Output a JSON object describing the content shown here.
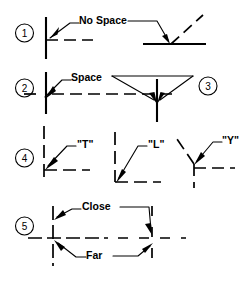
{
  "document": {
    "title": "Hidden Line Drafting Conventions",
    "type": "technical-line-drawing",
    "background_color": "#ffffff",
    "line_color": "#000000",
    "width": 246,
    "height": 282
  },
  "items": [
    {
      "number": "1",
      "marker": "①",
      "label": "No Space",
      "rule": "No space where a hidden line starts at a visible line",
      "figures": [
        {
          "name": "hidden-line-meets-vertical-solid",
          "kind": "solid-vertical-with-dashed-horizontal"
        },
        {
          "name": "hidden-line-meets-horizontal-solid",
          "kind": "solid-horizontal-with-dashed-diagonal"
        }
      ]
    },
    {
      "number": "2",
      "marker": "②",
      "label": "Space",
      "rule": "Leave a space where a hidden line crosses behind a visible line",
      "figures": [
        {
          "name": "dashed-crosses-solid-with-gap",
          "kind": "cross-with-space"
        }
      ]
    },
    {
      "number": "3",
      "marker": "③",
      "label": "",
      "rule": "Hidden line meeting a visible line at a junction",
      "figures": [
        {
          "name": "junction-double-leader",
          "kind": "v-leader-to-intersection"
        }
      ]
    },
    {
      "number": "4",
      "marker": "④",
      "label": "",
      "rule": "Hidden line junction shapes",
      "figures": [
        {
          "name": "t-junction",
          "label": "\"T\""
        },
        {
          "name": "l-junction",
          "label": "\"L\""
        },
        {
          "name": "y-junction",
          "label": "\"Y\""
        }
      ]
    },
    {
      "number": "5",
      "marker": "⑤",
      "label": "",
      "rule": "Dash placement when hidden lines cross",
      "figures": [
        {
          "name": "close-dash-crossing",
          "label": "Close"
        },
        {
          "name": "far-dash-crossing",
          "label": "Far"
        }
      ]
    }
  ],
  "labels": {
    "no_space": "No Space",
    "space": "Space",
    "t_junction": "\"T\"",
    "l_junction": "\"L\"",
    "y_junction": "\"Y\"",
    "close": "Close",
    "far": "Far",
    "n1": "1",
    "n2": "2",
    "n3": "3",
    "n4": "4",
    "n5": "5"
  }
}
